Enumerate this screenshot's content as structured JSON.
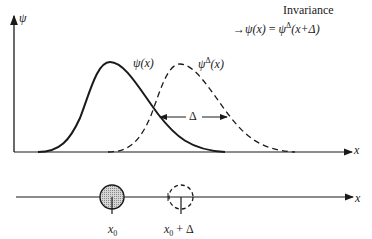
{
  "header": {
    "title": "Invariance",
    "equation": {
      "arrow": "→",
      "lhs": "ψ(x)",
      "equals": "=",
      "rhs_symbol": "ψ",
      "rhs_superscript": "Δ",
      "rhs_argument": "(x+Δ)"
    }
  },
  "top_plot": {
    "y_axis_label": "ψ",
    "x_axis_label": "x",
    "curves": [
      {
        "name": "original",
        "label_symbol": "ψ",
        "label_superscript": "",
        "label_argument": "(x)",
        "style": "solid",
        "peak_x": 110,
        "peak_y": 62
      },
      {
        "name": "translated",
        "label_symbol": "ψ",
        "label_superscript": "Δ",
        "label_argument": "(x)",
        "style": "dashed",
        "peak_x": 180,
        "peak_y": 64
      }
    ],
    "shift_label": "Δ"
  },
  "bottom_plot": {
    "x_axis_label": "x",
    "points": [
      {
        "name": "original-position",
        "label_main": "x",
        "label_sub": "0",
        "label_suffix": "",
        "style": "filled"
      },
      {
        "name": "shifted-position",
        "label_main": "x",
        "label_sub": "0",
        "label_suffix": " + Δ",
        "style": "dashed"
      }
    ]
  },
  "colors": {
    "ink": "#1a1a1a",
    "fill": "#bdbdbd"
  }
}
